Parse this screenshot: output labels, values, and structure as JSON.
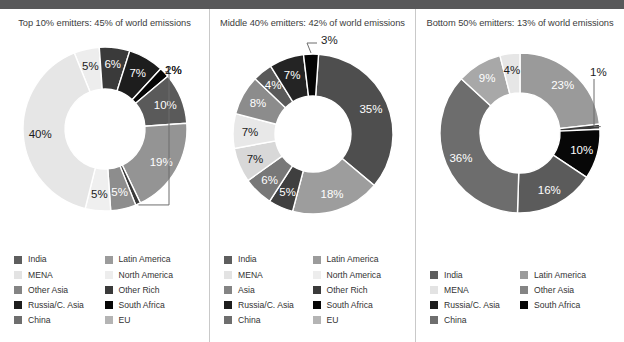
{
  "figure": {
    "top_bar_color": "#58585a",
    "divider_color": "#c9c9c9",
    "background": "#ffffff"
  },
  "palette": {
    "India": "#5e5e5e",
    "MENA": "#e3e3e3",
    "Other Asia": "#848484",
    "Asia": "#848484",
    "Russia/C. Asia": "#1d1d1d",
    "China": "#6e6e6e",
    "Latin America": "#9b9b9b",
    "North America": "#ededed",
    "Other Rich": "#3a3a3a",
    "South Africa": "#060606",
    "EU": "#b4b4b4"
  },
  "panels": [
    {
      "id": "top-10",
      "title": "Top 10% emitters: 45% of world emissions",
      "chart_data": {
        "type": "pie",
        "title": "Top 10% emitters: 45% of world emissions",
        "donut": true,
        "categories": [
          "North America",
          "Other Rich",
          "Russia/C. Asia",
          "South Africa",
          "China",
          "Latin America",
          "MENA",
          "Other Asia",
          "India",
          "EU"
        ],
        "values": [
          5,
          6,
          7,
          2,
          10,
          19,
          1,
          5,
          5,
          40
        ],
        "labels": [
          "5%",
          "6%",
          "7%",
          "2%",
          "10%",
          "19%",
          "1%",
          "5%",
          "5%",
          "40%"
        ],
        "callouts": [
          "2%",
          "1%"
        ]
      },
      "slices": [
        {
          "name": "North America",
          "value": 5,
          "label": "5%",
          "color": "#ededed",
          "label_color": "dark",
          "callout": false
        },
        {
          "name": "Other Rich",
          "value": 6,
          "label": "6%",
          "color": "#3a3a3a",
          "label_color": "light",
          "callout": false
        },
        {
          "name": "Russia/C. Asia",
          "value": 7,
          "label": "7%",
          "color": "#1d1d1d",
          "label_color": "light",
          "callout": false
        },
        {
          "name": "South Africa",
          "value": 2,
          "label": "2%",
          "color": "#060606",
          "label_color": "dark",
          "callout": true
        },
        {
          "name": "China",
          "value": 10,
          "label": "10%",
          "color": "#5a5a5a",
          "label_color": "light",
          "callout": false
        },
        {
          "name": "Latin America",
          "value": 19,
          "label": "19%",
          "color": "#949494",
          "label_color": "light",
          "callout": false
        },
        {
          "name": "EU",
          "value": 1,
          "label": "1%",
          "color": "#3a3a3a",
          "label_color": "dark",
          "callout": true
        },
        {
          "name": "Other Asia",
          "value": 5,
          "label": "5%",
          "color": "#8d8d8d",
          "label_color": "light",
          "callout": false
        },
        {
          "name": "India",
          "value": 5,
          "label": "5%",
          "color": "#efefef",
          "label_color": "dark",
          "callout": false
        },
        {
          "name": "MENA",
          "value": 40,
          "label": "40%",
          "color": "#e6e6e6",
          "label_color": "dark",
          "callout": false
        }
      ],
      "legend": [
        {
          "label": "India",
          "color": "#5e5e5e"
        },
        {
          "label": "MENA",
          "color": "#e3e3e3"
        },
        {
          "label": "Other Asia",
          "color": "#848484"
        },
        {
          "label": "Russia/C. Asia",
          "color": "#1d1d1d"
        },
        {
          "label": "China",
          "color": "#6e6e6e"
        },
        {
          "label": "Latin America",
          "color": "#9b9b9b"
        },
        {
          "label": "North America",
          "color": "#ededed"
        },
        {
          "label": "Other Rich",
          "color": "#3a3a3a"
        },
        {
          "label": "South Africa",
          "color": "#060606"
        },
        {
          "label": "EU",
          "color": "#b4b4b4"
        }
      ]
    },
    {
      "id": "middle-40",
      "title": "Middle 40% emitters: 42% of world emissions",
      "chart_data": {
        "type": "pie",
        "title": "Middle 40% emitters: 42% of world emissions",
        "donut": true,
        "categories": [
          "China",
          "Latin America",
          "Other Rich",
          "India",
          "MENA",
          "North America",
          "Asia",
          "EU",
          "Russia/C. Asia",
          "South Africa"
        ],
        "values": [
          35,
          18,
          5,
          6,
          7,
          7,
          8,
          4,
          7,
          3
        ],
        "labels": [
          "35%",
          "18%",
          "5%",
          "6%",
          "7%",
          "7%",
          "8%",
          "4%",
          "7%",
          "3%"
        ],
        "callouts": [
          "3%"
        ]
      },
      "slices": [
        {
          "name": "China",
          "value": 35,
          "label": "35%",
          "color": "#4e4e4e",
          "label_color": "light",
          "callout": false
        },
        {
          "name": "Latin America",
          "value": 18,
          "label": "18%",
          "color": "#9d9d9d",
          "label_color": "light",
          "callout": false
        },
        {
          "name": "Other Rich",
          "value": 5,
          "label": "5%",
          "color": "#3f3f3f",
          "label_color": "light",
          "callout": false
        },
        {
          "name": "India",
          "value": 6,
          "label": "6%",
          "color": "#787878",
          "label_color": "light",
          "callout": false
        },
        {
          "name": "North America",
          "value": 7,
          "label": "7%",
          "color": "#d8d8d8",
          "label_color": "dark",
          "callout": false
        },
        {
          "name": "MENA",
          "value": 7,
          "label": "7%",
          "color": "#e8e8e8",
          "label_color": "dark",
          "callout": false
        },
        {
          "name": "Asia",
          "value": 8,
          "label": "8%",
          "color": "#8c8c8c",
          "label_color": "light",
          "callout": false
        },
        {
          "name": "EU",
          "value": 4,
          "label": "4%",
          "color": "#5a5a5a",
          "label_color": "light",
          "callout": false
        },
        {
          "name": "Russia/C. Asia",
          "value": 7,
          "label": "7%",
          "color": "#242424",
          "label_color": "light",
          "callout": false
        },
        {
          "name": "South Africa",
          "value": 3,
          "label": "3%",
          "color": "#050505",
          "label_color": "dark",
          "callout": true
        }
      ],
      "legend": [
        {
          "label": "India",
          "color": "#5e5e5e"
        },
        {
          "label": "MENA",
          "color": "#e3e3e3"
        },
        {
          "label": "Asia",
          "color": "#848484"
        },
        {
          "label": "Russia/C. Asia",
          "color": "#1d1d1d"
        },
        {
          "label": "China",
          "color": "#6e6e6e"
        },
        {
          "label": "Latin America",
          "color": "#9b9b9b"
        },
        {
          "label": "North America",
          "color": "#ededed"
        },
        {
          "label": "Other Rich",
          "color": "#3a3a3a"
        },
        {
          "label": "South Africa",
          "color": "#060606"
        },
        {
          "label": "EU",
          "color": "#b4b4b4"
        }
      ]
    },
    {
      "id": "bottom-50",
      "title": "Bottom 50% emitters: 13% of world emissions",
      "chart_data": {
        "type": "pie",
        "title": "Bottom 50% emitters: 13% of world emissions",
        "donut": true,
        "categories": [
          "Other Asia",
          "Latin America",
          "South Africa",
          "India",
          "China",
          "MENA",
          "Russia/C. Asia"
        ],
        "values": [
          23,
          1,
          10,
          16,
          36,
          9,
          4
        ],
        "labels": [
          "23%",
          "1%",
          "10%",
          "16%",
          "36%",
          "9%",
          "4%"
        ],
        "callouts": [
          "1%"
        ]
      },
      "slices": [
        {
          "name": "Other Asia",
          "value": 23,
          "label": "23%",
          "color": "#9a9a9a",
          "label_color": "light",
          "callout": false
        },
        {
          "name": "Latin America",
          "value": 1,
          "label": "1%",
          "color": "#3a3a3a",
          "label_color": "dark",
          "callout": true
        },
        {
          "name": "South Africa",
          "value": 10,
          "label": "10%",
          "color": "#070707",
          "label_color": "light",
          "callout": false
        },
        {
          "name": "India",
          "value": 16,
          "label": "16%",
          "color": "#5b5b5b",
          "label_color": "light",
          "callout": false
        },
        {
          "name": "China",
          "value": 36,
          "label": "36%",
          "color": "#6d6d6d",
          "label_color": "light",
          "callout": false
        },
        {
          "name": "Russia/C. Asia",
          "value": 9,
          "label": "9%",
          "color": "#a8a8a8",
          "label_color": "light",
          "callout": false
        },
        {
          "name": "MENA",
          "value": 4,
          "label": "4%",
          "color": "#e6e6e6",
          "label_color": "dark",
          "callout": false
        }
      ],
      "legend": [
        {
          "label": "India",
          "color": "#5e5e5e"
        },
        {
          "label": "MENA",
          "color": "#e3e3e3"
        },
        {
          "label": "Russia/C. Asia",
          "color": "#1d1d1d"
        },
        {
          "label": "China",
          "color": "#6e6e6e"
        },
        {
          "label": "Latin America",
          "color": "#9b9b9b"
        },
        {
          "label": "Other Asia",
          "color": "#848484"
        },
        {
          "label": "South Africa",
          "color": "#060606"
        }
      ]
    }
  ]
}
